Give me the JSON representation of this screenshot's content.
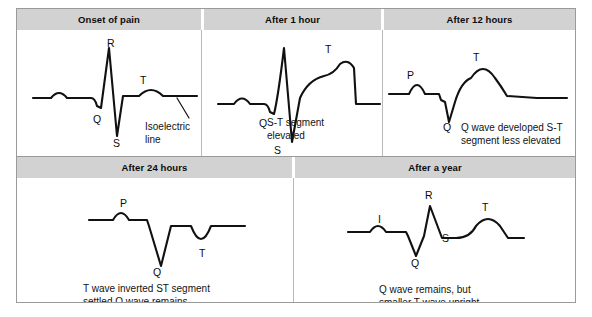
{
  "figure": {
    "title_band_color": "#d2d2d2",
    "border_color": "#9a9a9a",
    "trace_color": "#111111"
  },
  "panels": [
    {
      "id": "onset-of-pain",
      "header": "Onset of pain",
      "caption": "",
      "wave_labels": [
        {
          "name": "r-label",
          "text": "R"
        },
        {
          "name": "q-label",
          "text": "Q"
        },
        {
          "name": "s-label",
          "text": "S"
        },
        {
          "name": "t-label",
          "text": "T"
        }
      ],
      "annotation": "Isoelectric\nline"
    },
    {
      "id": "after-1-hour",
      "header": "After 1 hour",
      "caption": "S-T segment\nelevated",
      "wave_labels": [
        {
          "name": "q-label",
          "text": "Q"
        },
        {
          "name": "s-label",
          "text": "S"
        },
        {
          "name": "t-label",
          "text": "T"
        }
      ],
      "annotation": ""
    },
    {
      "id": "after-12-hours",
      "header": "After 12 hours",
      "caption": "Q wave developed S-T\nsegment less elevated",
      "wave_labels": [
        {
          "name": "p-label",
          "text": "P"
        },
        {
          "name": "q-label",
          "text": "Q"
        },
        {
          "name": "t-label",
          "text": "T"
        }
      ],
      "annotation": ""
    },
    {
      "id": "after-24-hours",
      "header": "After 24 hours",
      "caption": "T wave inverted ST segment\nsettled Q wave remains",
      "wave_labels": [
        {
          "name": "p-label",
          "text": "P"
        },
        {
          "name": "q-label",
          "text": "Q"
        },
        {
          "name": "t-label",
          "text": "T"
        }
      ],
      "annotation": ""
    },
    {
      "id": "after-a-year",
      "header": "After a year",
      "caption": "Q wave remains, but\nsmaller T wave upright",
      "wave_labels": [
        {
          "name": "p-label",
          "text": "I"
        },
        {
          "name": "r-label",
          "text": "R"
        },
        {
          "name": "q-label",
          "text": "Q"
        },
        {
          "name": "s-label",
          "text": "S"
        },
        {
          "name": "t-label",
          "text": "T"
        }
      ],
      "annotation": ""
    }
  ]
}
